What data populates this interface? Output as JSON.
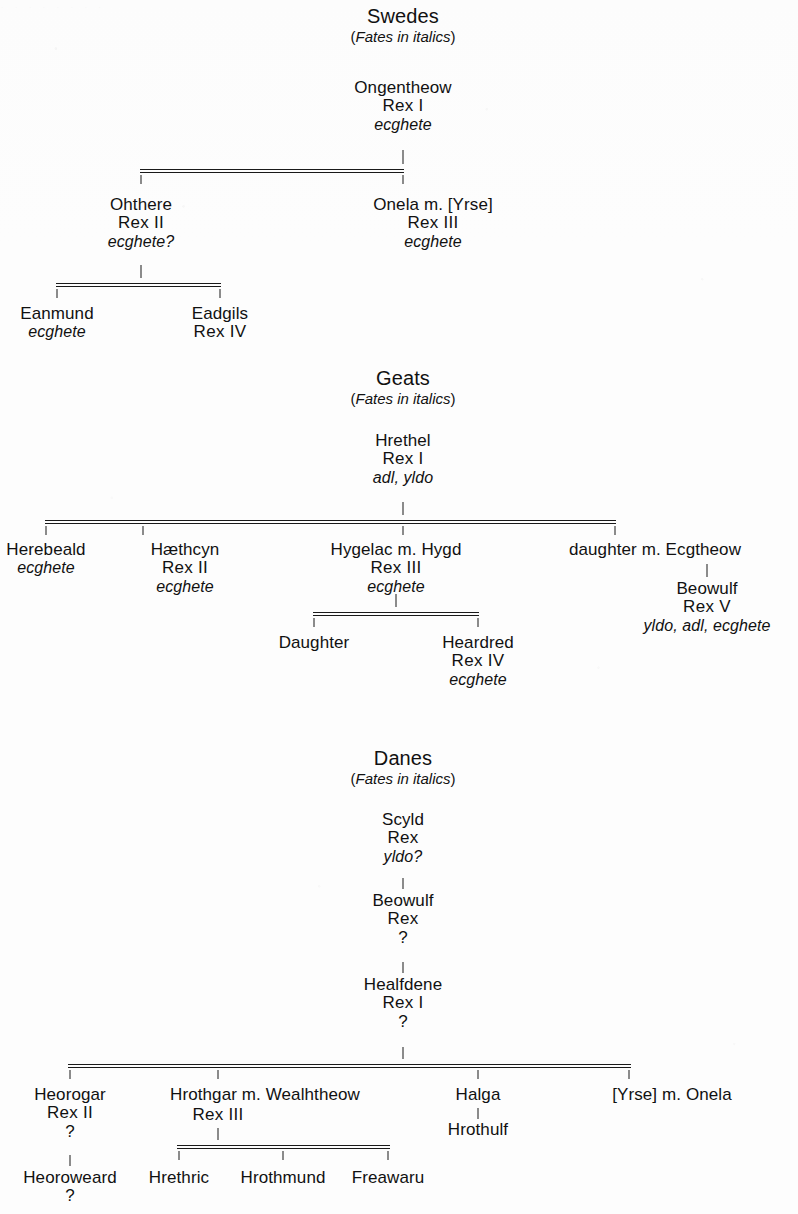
{
  "page": {
    "width": 798,
    "height": 1214,
    "background": "#fdfdfd",
    "ink": "#1a1a1a",
    "top_cropped_artifact": "·  ·   ·  ·   ·    ·   ·  ·",
    "bottom_cropped_marker": "?"
  },
  "groups": [
    {
      "id": "swedes",
      "title": "Swedes",
      "subtitle_open": "(",
      "subtitle_italic": "Fates in italics",
      "subtitle_close": ")"
    },
    {
      "id": "geats",
      "title": "Geats",
      "subtitle_open": "(",
      "subtitle_italic": "Fates in italics",
      "subtitle_close": ")"
    },
    {
      "id": "danes",
      "title": "Danes",
      "subtitle_open": "(",
      "subtitle_italic": "Fates in italics",
      "subtitle_close": ")"
    }
  ],
  "swedes": {
    "ongentheow": {
      "name": "Ongentheow",
      "rank": "Rex I",
      "fate": "ecghete"
    },
    "ohthere": {
      "name": "Ohthere",
      "rank": "Rex II",
      "fate": "ecghete?"
    },
    "onela": {
      "name": "Onela  m. [Yrse]",
      "rank": "Rex III",
      "fate": "ecghete"
    },
    "eanmund": {
      "name": "Eanmund",
      "rank": "",
      "fate": "ecghete"
    },
    "eadgils": {
      "name": "Eadgils",
      "rank": "Rex IV",
      "fate": ""
    }
  },
  "geats": {
    "hrethel": {
      "name": "Hrethel",
      "rank": "Rex I",
      "fate": "adl, yldo"
    },
    "herebeald": {
      "name": "Herebeald",
      "rank": "",
      "fate": "ecghete"
    },
    "haethcyn": {
      "name": "Hæthcyn",
      "rank": "Rex II",
      "fate": "ecghete"
    },
    "hygelac": {
      "name": "Hygelac  m.  Hygd",
      "rank": "Rex III",
      "fate": "ecghete"
    },
    "daughter_ecgtheow": {
      "name": "daughter  m. Ecgtheow",
      "rank": "",
      "fate": ""
    },
    "beowulf": {
      "name": "Beowulf",
      "rank": "Rex V",
      "fate": "yldo, adl, ecghete"
    },
    "daughter": {
      "name": "Daughter",
      "rank": "",
      "fate": ""
    },
    "heardred": {
      "name": "Heardred",
      "rank": "Rex IV",
      "fate": "ecghete"
    }
  },
  "danes": {
    "scyld": {
      "name": "Scyld",
      "rank": "Rex",
      "fate": "yldo?"
    },
    "beowulf": {
      "name": "Beowulf",
      "rank": "Rex",
      "fate": "?"
    },
    "healfdene": {
      "name": "Healfdene",
      "rank": "Rex I",
      "fate": "?"
    },
    "heorogar": {
      "name": "Heorogar",
      "rank": "Rex II",
      "fate": "?"
    },
    "heoroweard": {
      "name": "Heoroweard",
      "rank": "",
      "fate": "?"
    },
    "hrothgar": {
      "name": "Hrothgar m. Wealhtheow",
      "rank": "Rex III",
      "fate": ""
    },
    "halga": {
      "name": "Halga",
      "rank": "",
      "fate": ""
    },
    "hrothulf": {
      "name": "Hrothulf",
      "rank": "",
      "fate": ""
    },
    "yrse_onela": {
      "name": "[Yrse] m. Onela",
      "rank": "",
      "fate": ""
    },
    "hrethric": {
      "name": "Hrethric",
      "rank": "",
      "fate": ""
    },
    "hrothmund": {
      "name": "Hrothmund",
      "rank": "",
      "fate": ""
    },
    "freawaru": {
      "name": "Freawaru",
      "rank": "",
      "fate": ""
    }
  }
}
